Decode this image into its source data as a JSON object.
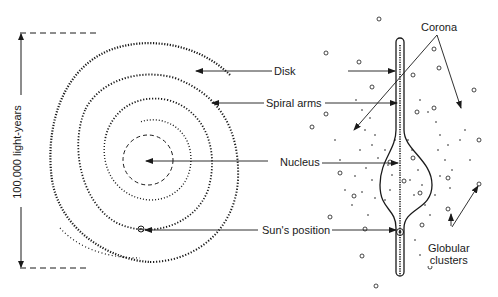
{
  "diagram": {
    "scale_label": "100,000 light-years",
    "labels": {
      "disk": "Disk",
      "spiral_arms": "Spiral arms",
      "nucleus": "Nucleus",
      "sun_position": "Sun's position",
      "corona": "Corona",
      "globular_clusters_line1": "Globular",
      "globular_clusters_line2": "clusters"
    },
    "colors": {
      "ink": "#1a1a1a",
      "background": "#ffffff"
    }
  }
}
